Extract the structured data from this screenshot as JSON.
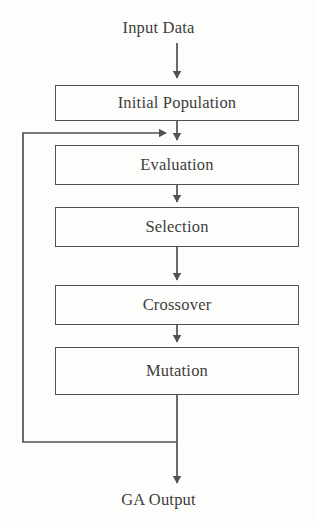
{
  "diagram": {
    "type": "flowchart",
    "stroke_color": "#515151",
    "text_color": "#3d3d3d",
    "background_color": "#fdfdfc"
  },
  "endpoints": {
    "input": "Input Data",
    "output": "GA Output"
  },
  "nodes": [
    {
      "id": "initial-population",
      "label": "Initial Population",
      "x": 55,
      "y": 85,
      "width": 244,
      "height": 36
    },
    {
      "id": "evaluation",
      "label": "Evaluation",
      "x": 55,
      "y": 145,
      "width": 244,
      "height": 40
    },
    {
      "id": "selection",
      "label": "Selection",
      "x": 55,
      "y": 207,
      "width": 244,
      "height": 40
    },
    {
      "id": "crossover",
      "label": "Crossover",
      "x": 55,
      "y": 285,
      "width": 244,
      "height": 40
    },
    {
      "id": "mutation",
      "label": "Mutation",
      "x": 55,
      "y": 347,
      "width": 244,
      "height": 48
    }
  ],
  "edges": [
    {
      "id": "input-to-initial",
      "from": "Input Data",
      "to": "Initial Population",
      "kind": "arrow-down"
    },
    {
      "id": "initial-to-evaluation",
      "from": "Initial Population",
      "to": "Evaluation",
      "kind": "arrow-down"
    },
    {
      "id": "evaluation-to-selection",
      "from": "Evaluation",
      "to": "Selection",
      "kind": "arrow-down"
    },
    {
      "id": "selection-to-crossover",
      "from": "Selection",
      "to": "Crossover",
      "kind": "arrow-down"
    },
    {
      "id": "crossover-to-mutation",
      "from": "Crossover",
      "to": "Mutation",
      "kind": "arrow-down"
    },
    {
      "id": "mutation-to-output",
      "from": "Mutation",
      "to": "GA Output",
      "kind": "arrow-down"
    },
    {
      "id": "feedback-loop",
      "from": "Mutation",
      "to": "Evaluation",
      "kind": "loop-left-arrow-right"
    }
  ]
}
